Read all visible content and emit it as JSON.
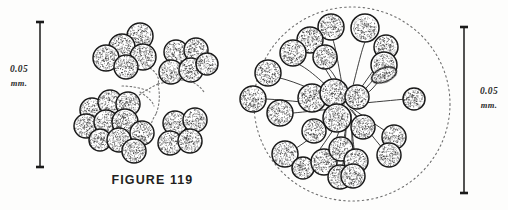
{
  "plate": {
    "caption": "FIGURE 119",
    "background_color": "#fdfdfc",
    "ink_color": "#1a1a1a"
  },
  "scale_bars": [
    {
      "id": "left",
      "value": "0.05",
      "unit": "mm.",
      "x": 40,
      "y_top": 22,
      "y_bottom": 167,
      "cap_half_width": 4
    },
    {
      "id": "right",
      "value": "0.05",
      "unit": "mm.",
      "x": 464,
      "y_top": 27,
      "y_bottom": 193,
      "cap_half_width": 4
    }
  ],
  "figures": [
    {
      "id": "left-figure",
      "name": "clustered-colony-drawing",
      "kind": "grape-like-cell-clusters",
      "clusters": [
        {
          "name": "upper-left-cluster",
          "cells": [
            {
              "cx": 140,
              "cy": 36,
              "r": 13
            },
            {
              "cx": 122,
              "cy": 47,
              "r": 13
            },
            {
              "cx": 143,
              "cy": 57,
              "r": 13
            },
            {
              "cx": 106,
              "cy": 58,
              "r": 13
            },
            {
              "cx": 126,
              "cy": 67,
              "r": 12
            }
          ]
        },
        {
          "name": "upper-right-cluster",
          "cells": [
            {
              "cx": 176,
              "cy": 52,
              "r": 12
            },
            {
              "cx": 196,
              "cy": 50,
              "r": 12
            },
            {
              "cx": 171,
              "cy": 72,
              "r": 12
            },
            {
              "cx": 191,
              "cy": 70,
              "r": 12
            },
            {
              "cx": 207,
              "cy": 64,
              "r": 11
            }
          ]
        },
        {
          "name": "lower-left-cluster",
          "cells": [
            {
              "cx": 92,
              "cy": 110,
              "r": 12
            },
            {
              "cx": 110,
              "cy": 102,
              "r": 12
            },
            {
              "cx": 128,
              "cy": 104,
              "r": 12
            },
            {
              "cx": 86,
              "cy": 126,
              "r": 12
            },
            {
              "cx": 106,
              "cy": 122,
              "r": 12
            },
            {
              "cx": 125,
              "cy": 122,
              "r": 13
            },
            {
              "cx": 100,
              "cy": 140,
              "r": 11
            },
            {
              "cx": 119,
              "cy": 140,
              "r": 12
            },
            {
              "cx": 142,
              "cy": 133,
              "r": 12
            },
            {
              "cx": 134,
              "cy": 151,
              "r": 12
            }
          ]
        },
        {
          "name": "lower-right-cluster",
          "cells": [
            {
              "cx": 175,
              "cy": 123,
              "r": 12
            },
            {
              "cx": 195,
              "cy": 120,
              "r": 12
            },
            {
              "cx": 170,
              "cy": 143,
              "r": 12
            },
            {
              "cx": 190,
              "cy": 141,
              "r": 12
            }
          ]
        }
      ],
      "filaments": [
        "M150,68 C156,72 160,78 158,84",
        "M158,84 C150,88 142,92 136,98",
        "M158,84 C166,82 176,80 186,80",
        "M158,84 C160,94 160,104 156,114",
        "M140,92 C146,96 152,100 154,106",
        "M122,86 C132,86 142,88 150,92",
        "M186,80 C194,82 200,86 204,92",
        "M156,114 C152,120 150,126 150,132"
      ]
    },
    {
      "id": "right-figure",
      "name": "radial-colony-drawing",
      "kind": "radiating-stalked-colony-in-gelatinous-envelope",
      "envelope": {
        "name": "gelatinous-envelope",
        "cx": 352,
        "cy": 104,
        "rx": 98,
        "ry": 97,
        "style": "dashed"
      },
      "hub": {
        "cx": 347,
        "cy": 106
      },
      "cells": [
        {
          "cx": 331,
          "cy": 27,
          "r": 13,
          "stalk": "M345,100 C340,75 336,48 333,40"
        },
        {
          "cx": 310,
          "cy": 40,
          "r": 13,
          "stalk": "M345,102 C332,80 320,58 313,53"
        },
        {
          "cx": 293,
          "cy": 53,
          "r": 13,
          "stalk": "M344,104 C328,86 308,68 298,64"
        },
        {
          "cx": 325,
          "cy": 57,
          "r": 12,
          "stalk": "M346,102 C340,84 332,70 328,68"
        },
        {
          "cx": 365,
          "cy": 28,
          "r": 14,
          "stalk": "M350,98 C356,74 362,48 365,42"
        },
        {
          "cx": 386,
          "cy": 47,
          "r": 12,
          "stalk": "M352,100 C366,82 378,62 384,58"
        },
        {
          "cx": 384,
          "cy": 65,
          "r": 13,
          "stalk": "M352,102 C366,90 376,76 381,70"
        },
        {
          "cx": 384,
          "cy": 75,
          "r": 9,
          "rx": 13,
          "ry": 7,
          "rot": -22,
          "stalk": "M353,104 C366,96 376,86 379,80"
        },
        {
          "cx": 268,
          "cy": 73,
          "r": 13,
          "stalk": "M342,105 C320,92 296,82 280,78"
        },
        {
          "cx": 253,
          "cy": 99,
          "r": 13,
          "stalk": "M340,106 C316,104 288,100 266,99"
        },
        {
          "cx": 280,
          "cy": 113,
          "r": 13,
          "stalk": "M341,108 C322,110 304,112 293,113"
        },
        {
          "cx": 312,
          "cy": 98,
          "r": 14,
          "stalk": "M344,104 C336,100 328,98 324,98"
        },
        {
          "cx": 334,
          "cy": 93,
          "r": 14,
          "stalk": "M346,102 C344,98 340,95 338,94"
        },
        {
          "cx": 357,
          "cy": 97,
          "r": 12,
          "stalk": "M349,102 C352,100 354,98 356,97"
        },
        {
          "cx": 414,
          "cy": 99,
          "r": 11,
          "stalk": "M354,104 C374,102 396,100 406,99"
        },
        {
          "cx": 337,
          "cy": 118,
          "r": 14,
          "stalk": "M347,109 C344,113 341,116 340,117"
        },
        {
          "cx": 314,
          "cy": 131,
          "r": 12,
          "stalk": "M345,110 C336,118 326,126 320,129"
        },
        {
          "cx": 363,
          "cy": 127,
          "r": 12,
          "stalk": "M350,109 C356,116 360,122 362,125"
        },
        {
          "cx": 394,
          "cy": 137,
          "r": 12,
          "stalk": "M352,108 C368,120 384,130 390,134"
        },
        {
          "cx": 389,
          "cy": 155,
          "r": 12,
          "stalk": "M352,110 C366,128 380,146 385,151"
        },
        {
          "cx": 285,
          "cy": 154,
          "r": 13,
          "stalk": "M344,110 C326,126 304,144 293,150"
        },
        {
          "cx": 303,
          "cy": 168,
          "r": 11,
          "stalk": "M345,112 C332,132 316,156 308,164"
        },
        {
          "cx": 324,
          "cy": 162,
          "r": 13,
          "stalk": "M346,112 C340,130 332,150 328,157"
        },
        {
          "cx": 340,
          "cy": 177,
          "r": 12,
          "stalk": "M347,113 C346,134 344,160 342,170"
        },
        {
          "cx": 341,
          "cy": 149,
          "r": 12,
          "stalk": "M348,112 C346,126 344,140 343,145"
        },
        {
          "cx": 356,
          "cy": 161,
          "r": 12,
          "stalk": "M350,112 C352,130 354,150 355,156"
        },
        {
          "cx": 353,
          "cy": 176,
          "r": 12,
          "stalk": "M351,114 C352,140 353,164 353,170"
        }
      ]
    }
  ]
}
